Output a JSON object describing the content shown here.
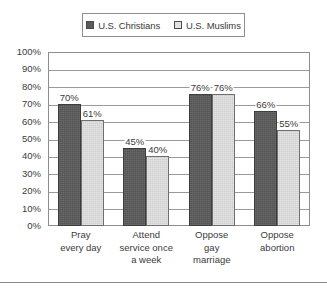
{
  "chart_data": {
    "type": "bar",
    "title": "",
    "subtitle": "",
    "xlabel": "",
    "ylabel": "",
    "ylim": [
      0,
      100
    ],
    "yticks": [
      "0%",
      "10%",
      "20%",
      "30%",
      "40%",
      "50%",
      "60%",
      "70%",
      "80%",
      "90%",
      "100%"
    ],
    "ytick_values": [
      0,
      10,
      20,
      30,
      40,
      50,
      60,
      70,
      80,
      90,
      100
    ],
    "grid": true,
    "legend_position": "top-center",
    "categories": [
      "Pray\never day",
      "Attend\nservice once\na week",
      "Oppose\ngay\nmarriage",
      "Oppose\nabortion"
    ],
    "category_lines": [
      [
        "Pray",
        "every day"
      ],
      [
        "Attend",
        "service once",
        "a week"
      ],
      [
        "Oppose",
        "gay",
        "marriage"
      ],
      [
        "Oppose",
        "abortion"
      ]
    ],
    "series": [
      {
        "name": "U.S. Christians",
        "color": "#5b5b5b",
        "values": [
          70,
          45,
          76,
          66
        ],
        "labels": [
          "70%",
          "45%",
          "76%",
          "66%"
        ]
      },
      {
        "name": "U.S. Muslims",
        "color": "#e2e2e2",
        "values": [
          61,
          40,
          76,
          55
        ],
        "labels": [
          "61%",
          "40%",
          "76%",
          "55%"
        ]
      }
    ]
  },
  "legend": {
    "entries": [
      {
        "label": "U.S. Christians",
        "swatch": "#5b5b5b"
      },
      {
        "label": "U.S. Muslims",
        "swatch": "#e2e2e2"
      }
    ]
  }
}
